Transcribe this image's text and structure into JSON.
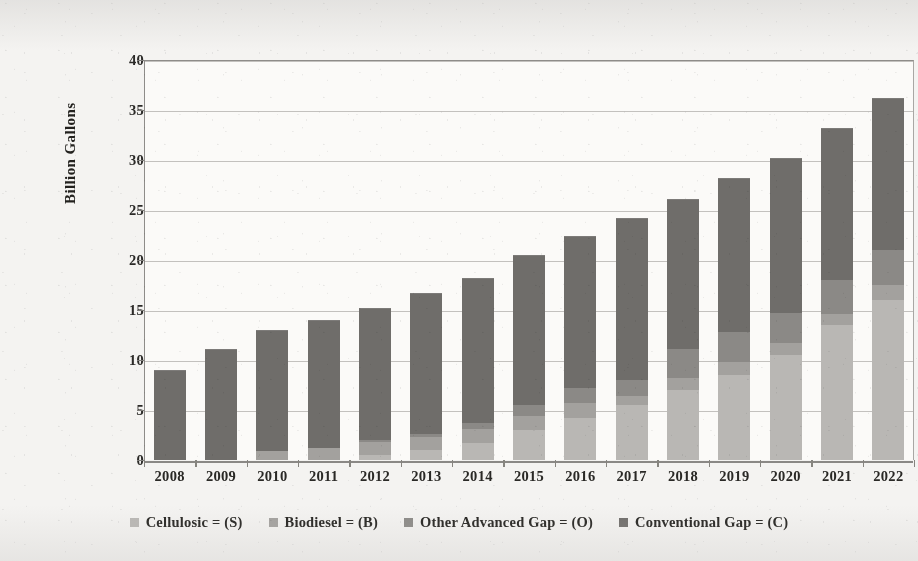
{
  "chart_data": {
    "type": "bar",
    "subtype": "stacked-bar",
    "title": "",
    "xlabel": "",
    "ylabel": "Billion Gallons",
    "ylim": [
      0,
      40
    ],
    "ytick_step": 5,
    "yticks": [
      "0",
      "5",
      "10",
      "15",
      "20",
      "25",
      "30",
      "35",
      "40"
    ],
    "grid": true,
    "legend_position": "bottom",
    "categories": [
      "2008",
      "2009",
      "2010",
      "2011",
      "2012",
      "2013",
      "2014",
      "2015",
      "2016",
      "2017",
      "2018",
      "2019",
      "2020",
      "2021",
      "2022"
    ],
    "series": [
      {
        "name": "Cellulosic = (S)",
        "short": "S",
        "color": "#b9b7b4",
        "values": [
          0.0,
          0.0,
          0.0,
          0.0,
          0.5,
          1.0,
          1.75,
          3.0,
          4.25,
          5.5,
          7.0,
          8.5,
          10.5,
          13.5,
          16.0
        ]
      },
      {
        "name": "Biodiesel = (B)",
        "short": "B",
        "color": "#a3a19e",
        "values": [
          0.0,
          0.0,
          0.95,
          1.2,
          1.3,
          1.35,
          1.35,
          1.4,
          1.45,
          0.9,
          1.2,
          1.3,
          1.2,
          1.1,
          1.5
        ]
      },
      {
        "name": "Other Advanced Gap = (O)",
        "short": "O",
        "color": "#8b8986",
        "values": [
          0.0,
          0.0,
          0.0,
          0.0,
          0.2,
          0.3,
          0.6,
          1.1,
          1.5,
          1.6,
          2.9,
          3.0,
          3.0,
          3.4,
          3.5
        ]
      },
      {
        "name": "Conventional Gap = (C)",
        "short": "C",
        "color": "#6f6d6a",
        "values": [
          9.0,
          11.1,
          12.05,
          12.8,
          13.2,
          14.05,
          14.5,
          15.0,
          15.2,
          16.2,
          15.0,
          15.4,
          15.5,
          15.2,
          15.2
        ]
      }
    ],
    "totals": [
      9.0,
      11.1,
      13.0,
      14.0,
      15.2,
      16.7,
      18.2,
      20.5,
      22.4,
      24.2,
      26.1,
      28.2,
      30.2,
      33.2,
      36.2
    ]
  },
  "legend": {
    "items": [
      {
        "label": "Cellulosic = (S)",
        "key": "s"
      },
      {
        "label": "Biodiesel = (B)",
        "key": "b"
      },
      {
        "label": "Other Advanced Gap = (O)",
        "key": "o"
      },
      {
        "label": "Conventional Gap = (C)",
        "key": "c"
      }
    ]
  },
  "axes": {
    "y_title": "Billion Gallons"
  }
}
